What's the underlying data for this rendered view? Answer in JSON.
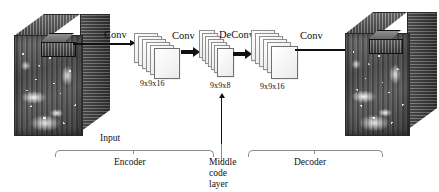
{
  "diagram": {
    "operations": {
      "conv1": "Conv",
      "conv2": "Conv",
      "deconv": "DeConv",
      "conv3": "Conv"
    },
    "feature_maps": [
      {
        "id": "enc-map-1",
        "label": "9x9x16",
        "cards": 6
      },
      {
        "id": "enc-map-2",
        "label": "9x9x16",
        "cards": 6
      },
      {
        "id": "middle-code",
        "label": "9x9x8",
        "cards": 7
      },
      {
        "id": "dec-map-1",
        "label": "9x9x16",
        "cards": 6
      }
    ],
    "cubes": {
      "input": {
        "name": "input-data-cube"
      },
      "output": {
        "name": "output-data-cube"
      }
    },
    "annotations": {
      "input": "Input",
      "encoder": "Encoder",
      "middle_code_layer": "Middle code\nlayer",
      "middle_code_layer_line1": "Middle code",
      "middle_code_layer_line2": "layer",
      "decoder": "Decoder"
    },
    "colors": {
      "ink": "#111111",
      "brace": "#8c8c8c",
      "card_fill": "#f4f4f4",
      "card_stroke": "#6f6f6f",
      "background": "#ffffff"
    }
  }
}
